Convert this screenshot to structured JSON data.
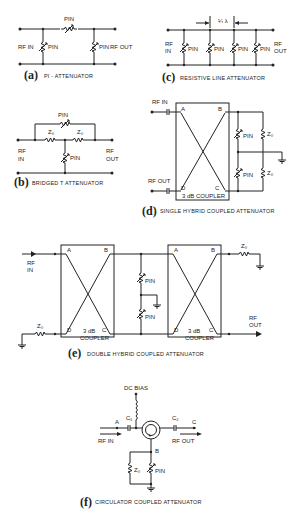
{
  "figures": {
    "a": {
      "letter": "(a)",
      "caption": "PI - ATTENUATOR",
      "rf_in": "RF IN",
      "rf_out": "RF OUT",
      "pin": "PIN"
    },
    "b": {
      "letter": "(b)",
      "caption": "BRIDGED T ATTENUATOR",
      "rf_in_1": "RF",
      "rf_in_2": "IN",
      "rf_out_1": "RF",
      "rf_out_2": "OUT",
      "pin": "PIN",
      "z0": "Z₀"
    },
    "c": {
      "letter": "(c)",
      "caption": "RESISTIVE LINE ATTENUATOR",
      "rf_in_1": "RF",
      "rf_in_2": "IN",
      "rf_out_1": "RF",
      "rf_out_2": "OUT",
      "pin": "PIN",
      "spacing": "¼ λ"
    },
    "d": {
      "letter": "(d)",
      "caption": "SINGLE HYBRID COUPLED ATTENUATOR",
      "rf_in": "RF IN",
      "rf_out": "RF OUT",
      "coupler": "3 dB COUPLER",
      "pin": "PIN",
      "z0": "Z₀",
      "port_a": "A",
      "port_b": "B",
      "port_c": "C",
      "port_d": "D"
    },
    "e": {
      "letter": "(e)",
      "caption": "DOUBLE HYBRID COUPLED ATTENUATOR",
      "rf_in_1": "RF",
      "rf_in_2": "IN",
      "rf_out_1": "RF",
      "rf_out_2": "OUT",
      "coupler_1": "3 dB",
      "coupler_2": "COUPLER",
      "pin": "PIN",
      "z0": "Z₀",
      "port_a": "A",
      "port_b": "B",
      "port_c": "C",
      "port_d": "D"
    },
    "f": {
      "letter": "(f)",
      "caption": "CIRCULATOR COUPLED ATTENUATOR",
      "dc_bias": "DC BIAS",
      "rf_in": "RF IN",
      "rf_out": "RF OUT",
      "c1": "C₁",
      "c2": "C₂",
      "pin": "PIN",
      "z0": "Z₀",
      "port_a": "A",
      "port_b": "B",
      "port_c": "C"
    }
  }
}
